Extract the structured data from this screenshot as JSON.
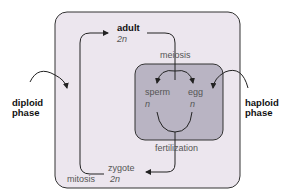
{
  "diagram": {
    "colors": {
      "outer_box": "#ece6ee",
      "inner_box": "#b9b4c3",
      "stroke": "#333333"
    },
    "side_labels": {
      "left": [
        "diploid",
        "phase"
      ],
      "right": [
        "haploid",
        "phase"
      ]
    },
    "nodes": {
      "adult": {
        "name": "adult",
        "ploidy": "2n"
      },
      "sperm": {
        "name": "sperm",
        "ploidy": "n"
      },
      "egg": {
        "name": "egg",
        "ploidy": "n"
      },
      "zygote": {
        "name": "zygote",
        "ploidy": "2n"
      }
    },
    "processes": {
      "meiosis": "meiosis",
      "fertilization": "fertilization",
      "mitosis": "mitosis"
    }
  }
}
